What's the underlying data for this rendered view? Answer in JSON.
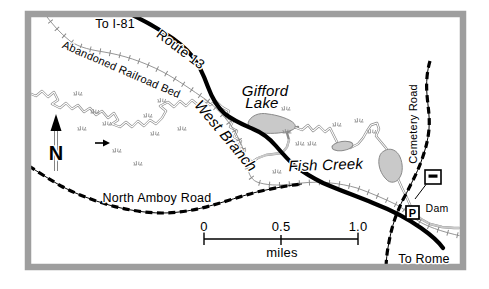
{
  "labels": {
    "to_i81": "To I-81",
    "route_13": "Route 13",
    "abandoned_railroad_bed": "Abandoned Railroad Bed",
    "gifford_lake": {
      "line1": "Gifford",
      "line2": "Lake"
    },
    "west_branch": "West Branch",
    "fish_creek": "Fish Creek",
    "cemetery_road": "Cemetery Road",
    "north_amboy_road": "North Amboy Road",
    "dam": "Dam",
    "to_rome": "To Rome"
  },
  "compass": {
    "north_label": "N"
  },
  "scale_bar": {
    "ticks": [
      "0",
      "0.5",
      "1.0"
    ],
    "unit": "miles"
  },
  "markers": {
    "parking_label": "P"
  },
  "colors": {
    "frame": "#9e9e9e",
    "water_fill": "#c9c9c9",
    "water_line": "#8a8a8a",
    "road": "#000000",
    "text": "#000000"
  }
}
